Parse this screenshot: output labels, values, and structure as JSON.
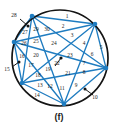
{
  "figure": {
    "caption": "(f)",
    "colors": {
      "circle": "#141414",
      "chord": "#1f7cc0",
      "vertex": "#1f7cc0",
      "label": "#1a1a1a",
      "background": "#ffffff",
      "leader": "#141414"
    },
    "circle": {
      "cx": 60,
      "cy": 58,
      "r": 48
    },
    "vertices": [
      {
        "id": "v1",
        "x": 32,
        "y": 16
      },
      {
        "id": "v2",
        "x": 95,
        "y": 24
      },
      {
        "id": "v3",
        "x": 106,
        "y": 68
      },
      {
        "id": "v4",
        "x": 64,
        "y": 104
      },
      {
        "id": "v5",
        "x": 22,
        "y": 83
      },
      {
        "id": "v6",
        "x": 14,
        "y": 42
      }
    ],
    "chords": [
      [
        "v1",
        "v2"
      ],
      [
        "v1",
        "v3"
      ],
      [
        "v1",
        "v4"
      ],
      [
        "v1",
        "v5"
      ],
      [
        "v1",
        "v6"
      ],
      [
        "v2",
        "v3"
      ],
      [
        "v2",
        "v4"
      ],
      [
        "v2",
        "v5"
      ],
      [
        "v2",
        "v6"
      ],
      [
        "v3",
        "v4"
      ],
      [
        "v3",
        "v5"
      ],
      [
        "v3",
        "v6"
      ],
      [
        "v4",
        "v5"
      ],
      [
        "v4",
        "v6"
      ],
      [
        "v5",
        "v6"
      ]
    ],
    "region_labels": [
      {
        "n": "1",
        "x": 67,
        "y": 17
      },
      {
        "n": "2",
        "x": 63,
        "y": 27
      },
      {
        "n": "3",
        "x": 72,
        "y": 36
      },
      {
        "n": "4",
        "x": 84,
        "y": 44
      },
      {
        "n": "5",
        "x": 101,
        "y": 48
      },
      {
        "n": "6",
        "x": 92,
        "y": 55
      },
      {
        "n": "7",
        "x": 84,
        "y": 64
      },
      {
        "n": "8",
        "x": 84,
        "y": 73
      },
      {
        "n": "9",
        "x": 76,
        "y": 86
      },
      {
        "n": "11",
        "x": 62,
        "y": 89
      },
      {
        "n": "12",
        "x": 50,
        "y": 87
      },
      {
        "n": "13",
        "x": 40,
        "y": 86
      },
      {
        "n": "14",
        "x": 37,
        "y": 96
      },
      {
        "n": "16",
        "x": 22,
        "y": 57
      },
      {
        "n": "17",
        "x": 31,
        "y": 66
      },
      {
        "n": "18",
        "x": 38,
        "y": 76
      },
      {
        "n": "19",
        "x": 48,
        "y": 70
      },
      {
        "n": "20",
        "x": 36,
        "y": 56
      },
      {
        "n": "21",
        "x": 68,
        "y": 74
      },
      {
        "n": "22",
        "x": 57,
        "y": 64
      },
      {
        "n": "23",
        "x": 70,
        "y": 56
      },
      {
        "n": "24",
        "x": 54,
        "y": 44
      },
      {
        "n": "25",
        "x": 36,
        "y": 42
      },
      {
        "n": "26",
        "x": 24,
        "y": 44
      },
      {
        "n": "27",
        "x": 25,
        "y": 33
      },
      {
        "n": "29",
        "x": 36,
        "y": 30
      },
      {
        "n": "30",
        "x": 47,
        "y": 30
      }
    ],
    "callout_labels": [
      {
        "n": "28",
        "x": 14,
        "y": 16,
        "line": {
          "x1": 20,
          "y1": 19,
          "x2": 28,
          "y2": 26
        }
      },
      {
        "n": "15",
        "x": 7,
        "y": 70,
        "line": {
          "x1": 12,
          "y1": 67,
          "x2": 19,
          "y2": 62
        }
      },
      {
        "n": "10",
        "x": 95,
        "y": 98,
        "line": {
          "x1": 93,
          "y1": 95,
          "x2": 85,
          "y2": 89
        }
      }
    ],
    "center_pointer": {
      "x1": 61,
      "y1": 58,
      "x2": 55,
      "y2": 66
    }
  }
}
